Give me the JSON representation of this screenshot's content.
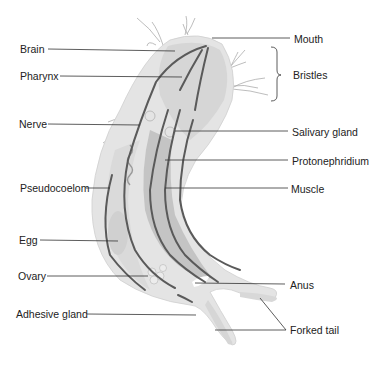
{
  "diagram": {
    "labels_left": [
      {
        "id": "brain",
        "text": "Brain",
        "x": 20,
        "y": 43
      },
      {
        "id": "pharynx",
        "text": "Pharynx",
        "x": 20,
        "y": 70
      },
      {
        "id": "nerve",
        "text": "Nerve",
        "x": 19,
        "y": 118
      },
      {
        "id": "pseudocoelom",
        "text": "Pseudocoelom",
        "x": 20,
        "y": 182
      },
      {
        "id": "egg",
        "text": "Egg",
        "x": 19,
        "y": 234
      },
      {
        "id": "ovary",
        "text": "Ovary",
        "x": 18,
        "y": 270
      },
      {
        "id": "adhesive-gland",
        "text": "Adhesive gland",
        "x": 16,
        "y": 308
      }
    ],
    "labels_right": [
      {
        "id": "mouth",
        "text": "Mouth",
        "x": 294,
        "y": 33
      },
      {
        "id": "bristles",
        "text": "Bristles",
        "x": 293,
        "y": 69
      },
      {
        "id": "salivary-gland",
        "text": "Salivary gland",
        "x": 292,
        "y": 126
      },
      {
        "id": "protonephridium",
        "text": "Protonephridium",
        "x": 292,
        "y": 155
      },
      {
        "id": "muscle",
        "text": "Muscle",
        "x": 291,
        "y": 183
      },
      {
        "id": "anus",
        "text": "Anus",
        "x": 290,
        "y": 279
      },
      {
        "id": "forked-tail",
        "text": "Forked tail",
        "x": 290,
        "y": 324
      }
    ],
    "colors": {
      "body_outer": "#e3e3e3",
      "body_inner": "#d2d2d2",
      "organ": "#bdbdbd",
      "muscle": "#555555",
      "leader_line": "#333333",
      "text": "#222222",
      "bristle": "#9a9a9a"
    }
  }
}
